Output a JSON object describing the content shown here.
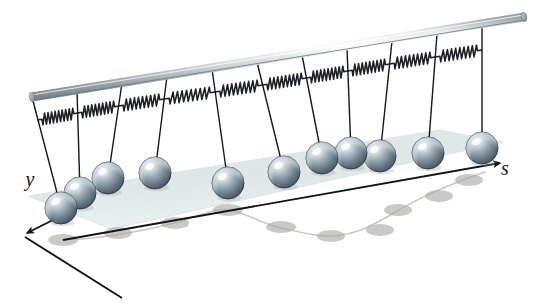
{
  "figure": {
    "background_color": "#ffffff"
  },
  "axes": {
    "y_label": "y",
    "s_label": "s",
    "y_label_pos": {
      "x": 30,
      "y": 186
    },
    "s_label_pos": {
      "x": 505,
      "y": 175
    },
    "axis_color": "#111418",
    "origin": {
      "x": 63,
      "y": 240
    },
    "s_axis_end": {
      "x": 500,
      "y": 163
    },
    "y_axis_end": {
      "x": 27,
      "y": 233
    },
    "depth_axis_end": {
      "x": 122,
      "y": 298
    }
  },
  "plane": {
    "fill_color": "#e2e9e9",
    "edge_color": "#d5dedd",
    "points": "28,196 440,130 503,142 111,229"
  },
  "rod": {
    "label": "support-rod",
    "color_light": "#f2f4f5",
    "color_mid": "#b9c0c3",
    "color_dark": "#848c90",
    "start": {
      "x": 32,
      "y": 97
    },
    "end": {
      "x": 524,
      "y": 17
    },
    "thickness": 9
  },
  "bob": {
    "radius": 16,
    "color_dark": "#5a6a74",
    "color_mid": "#8b9aa4",
    "color_light": "#d5dde2",
    "highlight_color": "#eef2f4",
    "outline_color": "#2e3a42"
  },
  "string": {
    "color": "#14181c",
    "width": 1.4
  },
  "spring": {
    "color": "#1c2126",
    "coils": 9
  },
  "shadow": {
    "fill_color": "#a8a9a3",
    "opacity": 0.62,
    "curve_color": "#b6b8b2"
  },
  "pendulums": [
    {
      "id": 1,
      "anchor_x": 32,
      "anchor_y": 97,
      "bob_x": 61,
      "bob_y": 208,
      "spring_y": 120
    },
    {
      "id": 2,
      "anchor_x": 77,
      "anchor_y": 90,
      "bob_x": 80,
      "bob_y": 193,
      "spring_y": 113
    },
    {
      "id": 3,
      "anchor_x": 122,
      "anchor_y": 83,
      "bob_x": 108,
      "bob_y": 178,
      "spring_y": 106
    },
    {
      "id": 4,
      "anchor_x": 167,
      "anchor_y": 76,
      "bob_x": 155,
      "bob_y": 173,
      "spring_y": 99
    },
    {
      "id": 5,
      "anchor_x": 212,
      "anchor_y": 69,
      "bob_x": 228,
      "bob_y": 183,
      "spring_y": 92
    },
    {
      "id": 6,
      "anchor_x": 257,
      "anchor_y": 62,
      "bob_x": 284,
      "bob_y": 172,
      "spring_y": 85
    },
    {
      "id": 7,
      "anchor_x": 302,
      "anchor_y": 55,
      "bob_x": 322,
      "bob_y": 158,
      "spring_y": 78
    },
    {
      "id": 8,
      "anchor_x": 347,
      "anchor_y": 48,
      "bob_x": 351,
      "bob_y": 153,
      "spring_y": 71
    },
    {
      "id": 9,
      "anchor_x": 392,
      "anchor_y": 41,
      "bob_x": 380,
      "bob_y": 156,
      "spring_y": 64
    },
    {
      "id": 10,
      "anchor_x": 437,
      "anchor_y": 34,
      "bob_x": 428,
      "bob_y": 153,
      "spring_y": 57
    },
    {
      "id": 11,
      "anchor_x": 482,
      "anchor_y": 27,
      "bob_x": 482,
      "bob_y": 148,
      "spring_y": 50
    }
  ],
  "shadow_dots": [
    {
      "x": 63,
      "y": 240,
      "rx": 15,
      "ry": 6
    },
    {
      "x": 118,
      "y": 233,
      "rx": 14,
      "ry": 6
    },
    {
      "x": 175,
      "y": 223,
      "rx": 14,
      "ry": 6
    },
    {
      "x": 228,
      "y": 210,
      "rx": 15,
      "ry": 6
    },
    {
      "x": 281,
      "y": 227,
      "rx": 15,
      "ry": 6
    },
    {
      "x": 331,
      "y": 236,
      "rx": 14,
      "ry": 6
    },
    {
      "x": 380,
      "y": 230,
      "rx": 14,
      "ry": 6
    },
    {
      "x": 398,
      "y": 210,
      "rx": 14,
      "ry": 6
    },
    {
      "x": 439,
      "y": 196,
      "rx": 14,
      "ry": 6
    },
    {
      "x": 469,
      "y": 180,
      "rx": 14,
      "ry": 6
    }
  ],
  "shadow_curve": "M63,240 C100,239 142,231 175,223 C200,216 214,208 228,210 C250,214 262,224 281,228 C305,233 318,237 334,236 C356,234 372,226 392,214 C420,197 450,184 485,172"
}
